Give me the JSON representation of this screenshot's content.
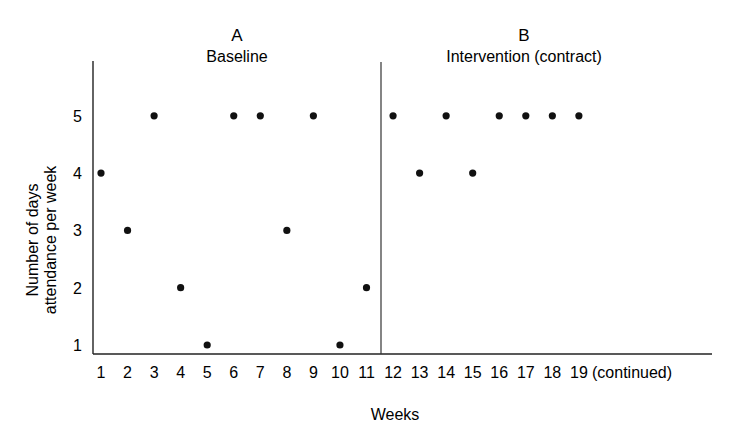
{
  "chart_data": {
    "type": "scatter",
    "title": "",
    "xlabel": "Weeks",
    "ylabel": "Number of days attendance per week",
    "ylabel_lines": [
      "Number of days",
      "attendance per week"
    ],
    "x_ticks": [
      "1",
      "2",
      "3",
      "4",
      "5",
      "6",
      "7",
      "8",
      "9",
      "10",
      "11",
      "12",
      "13",
      "14",
      "15",
      "16",
      "17",
      "18",
      "19"
    ],
    "x_continuation_label": "(continued)",
    "y_ticks": [
      1,
      2,
      3,
      4,
      5
    ],
    "ylim": [
      1,
      5
    ],
    "xlim": [
      1,
      19
    ],
    "grid": false,
    "legend": null,
    "phase_change_after_week": 11,
    "phases": [
      {
        "letter": "A",
        "name": "Baseline",
        "x": [
          1,
          2,
          3,
          4,
          5,
          6,
          7,
          8,
          9,
          10,
          11
        ],
        "values": [
          4,
          3,
          5,
          2,
          1,
          5,
          5,
          3,
          5,
          1,
          2
        ]
      },
      {
        "letter": "B",
        "name": "Intervention (contract)",
        "x": [
          12,
          13,
          14,
          15,
          16,
          17,
          18,
          19
        ],
        "values": [
          5,
          4,
          5,
          4,
          5,
          5,
          5,
          5
        ]
      }
    ],
    "colors": {
      "ink": "#111111",
      "background": "#ffffff"
    }
  }
}
